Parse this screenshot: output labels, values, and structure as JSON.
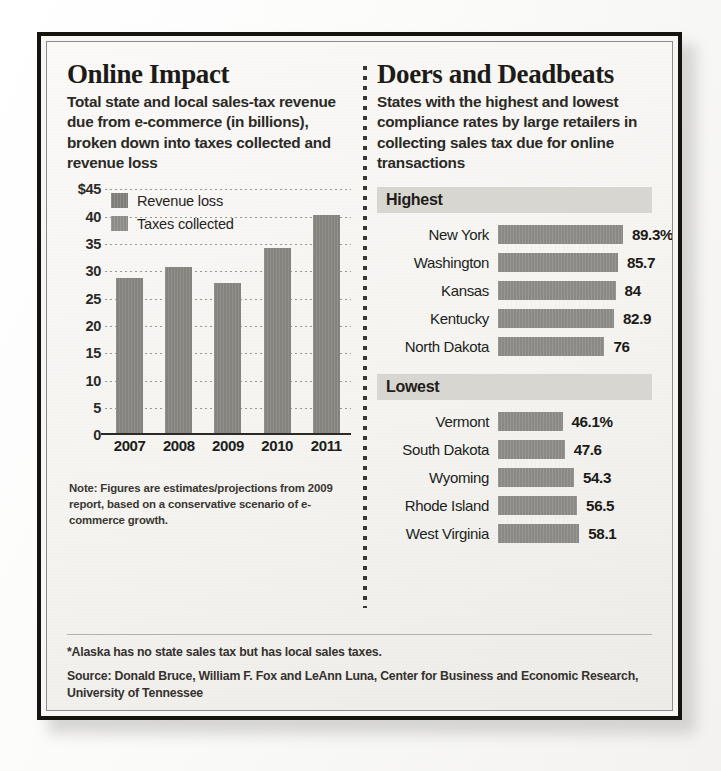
{
  "left_panel": {
    "title": "Online Impact",
    "deck": "Total state and local sales-tax revenue due from e-commerce (in billions), broken down into taxes collected and revenue loss",
    "note": "Note: Figures are estimates/projections from 2009 report, based on a conservative scenario of e-commerce growth.",
    "legend": [
      {
        "label": "Revenue loss",
        "color": "#7e7c77"
      },
      {
        "label": "Taxes collected",
        "color": "#8d8b86"
      }
    ]
  },
  "right_panel": {
    "title": "Doers and Deadbeats",
    "deck": "States with the highest and lowest compliance rates by large retailers in collecting sales tax due for online transactions",
    "sections": [
      {
        "heading": "Highest",
        "rows": [
          {
            "state": "New York",
            "value": 89.3,
            "value_label": "89.3%"
          },
          {
            "state": "Washington",
            "value": 85.7,
            "value_label": "85.7"
          },
          {
            "state": "Kansas",
            "value": 84,
            "value_label": "84"
          },
          {
            "state": "Kentucky",
            "value": 82.9,
            "value_label": "82.9"
          },
          {
            "state": "North Dakota",
            "value": 76,
            "value_label": "76"
          }
        ]
      },
      {
        "heading": "Lowest",
        "rows": [
          {
            "state": "Vermont",
            "value": 46.1,
            "value_label": "46.1%"
          },
          {
            "state": "South Dakota",
            "value": 47.6,
            "value_label": "47.6"
          },
          {
            "state": "Wyoming",
            "value": 54.3,
            "value_label": "54.3"
          },
          {
            "state": "Rhode Island",
            "value": 56.5,
            "value_label": "56.5"
          },
          {
            "state": "West Virginia",
            "value": 58.1,
            "value_label": "58.1"
          }
        ]
      }
    ]
  },
  "footer": {
    "footnote": "*Alaska has no state sales tax but has local sales taxes.",
    "source": "Source: Donald Bruce, William F. Fox and LeAnn Luna, Center for Business and Economic Research, University of Tennessee"
  },
  "chart_data": {
    "type": "bar",
    "title": "Online Impact",
    "subtitle": "Total state and local sales-tax revenue due from e-commerce (in billions), broken down into taxes collected and revenue loss",
    "categories": [
      "2007",
      "2008",
      "2009",
      "2010",
      "2011"
    ],
    "values": [
      28.5,
      30.5,
      27.5,
      34,
      40
    ],
    "series": [
      {
        "name": "Revenue loss and taxes collected (total)",
        "values": [
          28.5,
          30.5,
          27.5,
          34,
          40
        ]
      }
    ],
    "legend_entries": [
      "Revenue loss",
      "Taxes collected"
    ],
    "legend_position": "top-left-inside",
    "xlabel": "",
    "ylabel": "",
    "ylim": [
      0,
      45
    ],
    "yticks": [
      0,
      5,
      10,
      15,
      20,
      25,
      30,
      35,
      40,
      45
    ],
    "ytick_labels": [
      "0",
      "5",
      "10",
      "15",
      "20",
      "25",
      "30",
      "35",
      "40",
      "$45"
    ],
    "grid": true,
    "bar_color": "#85837e",
    "note": "Note: Figures are estimates/projections from 2009 report, based on a conservative scenario of e-commerce growth."
  },
  "chart_data_right": [
    {
      "type": "bar",
      "orientation": "horizontal",
      "title": "Highest",
      "categories": [
        "New York",
        "Washington",
        "Kansas",
        "Kentucky",
        "North Dakota"
      ],
      "values": [
        89.3,
        85.7,
        84,
        82.9,
        76
      ],
      "xlim": [
        0,
        100
      ],
      "grid": false
    },
    {
      "type": "bar",
      "orientation": "horizontal",
      "title": "Lowest",
      "categories": [
        "Vermont",
        "South Dakota",
        "Wyoming",
        "Rhode Island",
        "West Virginia"
      ],
      "values": [
        46.1,
        47.6,
        54.3,
        56.5,
        58.1
      ],
      "xlim": [
        0,
        100
      ],
      "grid": false
    }
  ]
}
